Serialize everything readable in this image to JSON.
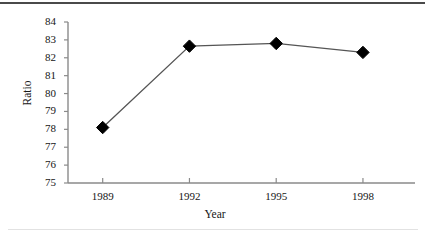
{
  "chart_data": {
    "type": "line",
    "title": "",
    "xlabel": "Year",
    "ylabel": "Ratio",
    "x": [
      1989,
      1992,
      1995,
      1998
    ],
    "categories": [
      "1989",
      "1992",
      "1995",
      "1998"
    ],
    "values": [
      78.1,
      82.65,
      82.8,
      82.3
    ],
    "series": [
      {
        "name": "Ratio",
        "values": [
          78.1,
          82.65,
          82.8,
          82.3
        ],
        "marker": "diamond",
        "marker_color": "#000000",
        "line_color": "#555555"
      }
    ],
    "xtick_labels": [
      "1989",
      "1992",
      "1995",
      "1998"
    ],
    "ytick_labels": [
      "75",
      "76",
      "77",
      "78",
      "79",
      "80",
      "81",
      "82",
      "83",
      "84"
    ],
    "ytick_values": [
      75,
      76,
      77,
      78,
      79,
      80,
      81,
      82,
      83,
      84
    ],
    "ylim": [
      75,
      84
    ],
    "xlim": [
      1987.8,
      1999.8
    ],
    "grid": false,
    "legend": false,
    "legend_position": "none",
    "axis_color": "#8a8a8a",
    "background_color": "#ffffff"
  },
  "figure": {
    "top_rule_color": "#4a4a4a",
    "bottom_rule_color": "#e2e2e2"
  }
}
